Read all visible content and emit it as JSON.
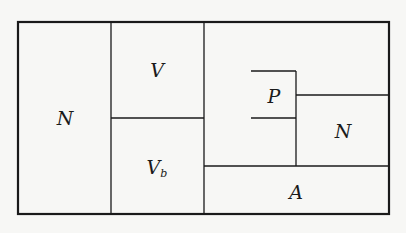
{
  "diagram": {
    "type": "partition-diagram",
    "colors": {
      "line": "#1a1a1a",
      "background": "#f7f7f5"
    },
    "regions": [
      {
        "id": "N-left",
        "label": "N",
        "sub": "",
        "x": 65,
        "y": 118
      },
      {
        "id": "V-top",
        "label": "V",
        "sub": "",
        "x": 157,
        "y": 70
      },
      {
        "id": "Vb",
        "label": "V",
        "sub": "b",
        "x": 155,
        "y": 168
      },
      {
        "id": "P",
        "label": "P",
        "sub": "",
        "x": 274,
        "y": 96
      },
      {
        "id": "N-right",
        "label": "N",
        "sub": "",
        "x": 343,
        "y": 131
      },
      {
        "id": "A",
        "label": "A",
        "sub": "",
        "x": 296,
        "y": 192
      }
    ]
  }
}
